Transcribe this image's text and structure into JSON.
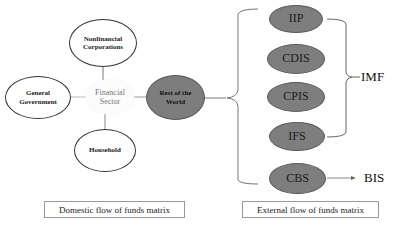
{
  "domestic": {
    "nodes": {
      "nonfinancial": "Nonfinancial Corporations",
      "government": "General Government",
      "financial": "Financial Sector",
      "rest_of_world": "Rest of the World",
      "household": "Household"
    },
    "caption": "Domestic flow of funds matrix"
  },
  "external": {
    "datasets": [
      "IIP",
      "CDIS",
      "CPIS",
      "IFS",
      "CBS"
    ],
    "caption": "External flow of funds matrix"
  },
  "organizations": {
    "imf": "IMF",
    "bis": "BIS"
  },
  "colors": {
    "dark_node": "#7d7d7d",
    "outline": "#333333",
    "line": "#9a9a9a"
  }
}
